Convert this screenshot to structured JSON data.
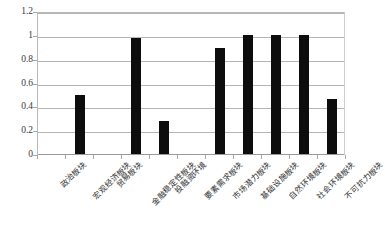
{
  "chart_data": {
    "type": "bar",
    "title": "",
    "subtitle": "",
    "xlabel": "",
    "ylabel": "",
    "ylim": [
      0,
      1.2
    ],
    "yticks": [
      "0",
      "0.2",
      "0.4",
      "0.6",
      "0.8",
      "1",
      "1.2"
    ],
    "ytick_values": [
      0,
      0.2,
      0.4,
      0.6,
      0.8,
      1,
      1.2
    ],
    "grid": "horizontal",
    "legend": "none",
    "bar_color": "#0d0d0d",
    "gridline_color": "#b5b5b5",
    "plot_background": "#ffffff",
    "categories": [
      "政治板块",
      "宏观经济板块",
      "贸易板块",
      "金融稳定性板块",
      "投融资环境",
      "要素需求板块",
      "市场潜力板块",
      "基础设施板块",
      "自然环境板块",
      "社会环境板块",
      "不可抗力板块"
    ],
    "values": [
      0,
      0.5,
      0,
      0.99,
      0.28,
      0,
      0.9,
      1.01,
      1.01,
      1.01,
      0.47
    ]
  }
}
